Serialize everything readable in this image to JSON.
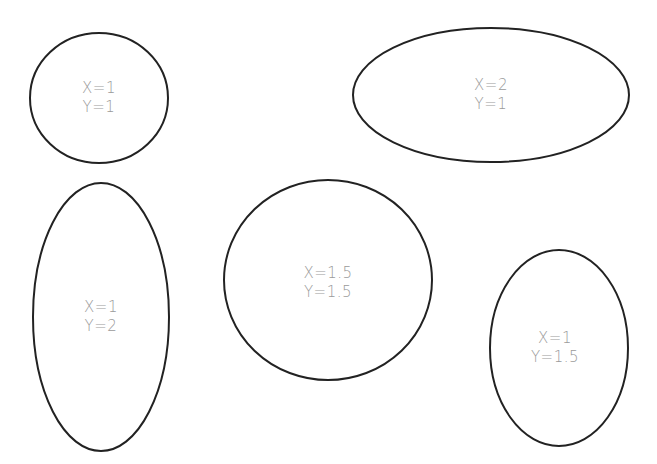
{
  "diagram": {
    "stroke_color": "#222222",
    "text_color": "#9a9a9a",
    "background": "#ffffff",
    "shapes": [
      {
        "id": "ellipse-1",
        "cx": 99,
        "cy": 98,
        "rx": 69,
        "ry": 65,
        "x_label": "X=1",
        "y_label": "Y=1"
      },
      {
        "id": "ellipse-2",
        "cx": 491,
        "cy": 95,
        "rx": 138,
        "ry": 67,
        "x_label": "X=2",
        "y_label": "Y=1"
      },
      {
        "id": "ellipse-3",
        "cx": 101,
        "cy": 317,
        "rx": 68,
        "ry": 134,
        "x_label": "X=1",
        "y_label": "Y=2"
      },
      {
        "id": "ellipse-4",
        "cx": 328,
        "cy": 280,
        "rx": 104,
        "ry": 100,
        "x_label": "X=1.5",
        "y_label": "Y=1.5"
      },
      {
        "id": "ellipse-5",
        "cx": 559,
        "cy": 348,
        "rx": 69,
        "ry": 98,
        "x_label": "X=1",
        "y_label": "Y=1.5"
      }
    ]
  }
}
